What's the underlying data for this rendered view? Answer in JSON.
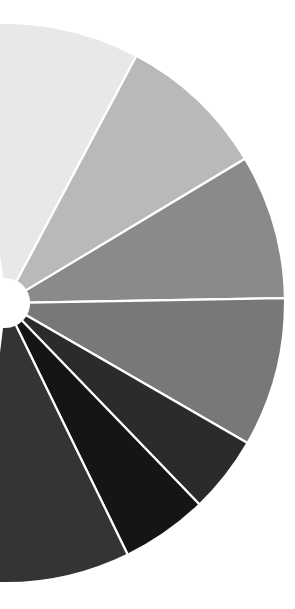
{
  "chart": {
    "title": "",
    "background_color": "#ffffff",
    "separator_color": "#ffffff"
  },
  "chart_data": {
    "type": "pie",
    "title": "",
    "subtitle": "",
    "xlabel": "",
    "ylabel": "",
    "variant": "donut",
    "grid": false,
    "legend": "none",
    "annotations": [],
    "geometry": {
      "center_x": 5,
      "center_y": 303,
      "outer_radius": 280,
      "inner_radius": 24,
      "visible_arc_start_deg": -97,
      "visible_arc_end_deg": 97,
      "note": "only the right-hand portion of the donut is inside the canvas; the left side is cropped off-screen"
    },
    "categories": [
      "Slice 1",
      "Slice 2",
      "Slice 3",
      "Slice 4",
      "Slice 5",
      "Slice 6",
      "Slice 7"
    ],
    "values": [
      35,
      31,
      30,
      31,
      16,
      18,
      33
    ],
    "colors": [
      "#e8e8e8",
      "#b9b9b9",
      "#8a8a8a",
      "#787878",
      "#2b2b2b",
      "#151515",
      "#343434"
    ],
    "slice_angles_deg": [
      {
        "start": -97,
        "end": -62
      },
      {
        "start": -62,
        "end": -31
      },
      {
        "start": -31,
        "end": -1
      },
      {
        "start": -1,
        "end": 30
      },
      {
        "start": 30,
        "end": 46
      },
      {
        "start": 46,
        "end": 64
      },
      {
        "start": 64,
        "end": 97
      }
    ],
    "tick_labels": [],
    "data_labels": []
  }
}
